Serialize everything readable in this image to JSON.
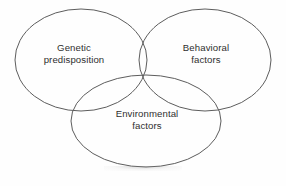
{
  "diagram": {
    "type": "venn-three-circle",
    "title": "",
    "background_color": "#fefefe",
    "outline_color": "#5d5d5d",
    "text_color": "#2f2f2f",
    "sets": [
      {
        "id": "genetic",
        "label_lines": [
          "Genetic",
          "predisposition"
        ],
        "line1": "Genetic",
        "line2": "predisposition",
        "position": "upper-left"
      },
      {
        "id": "behavioral",
        "label_lines": [
          "Behavioral",
          "factors"
        ],
        "line1": "Behavioral",
        "line2": "factors",
        "position": "upper-right"
      },
      {
        "id": "environmental",
        "label_lines": [
          "Environmental",
          "factors"
        ],
        "line1": "Environmental",
        "line2": "factors",
        "position": "bottom-center"
      }
    ],
    "geometry": {
      "genetic": {
        "cx": 81,
        "cy": 60,
        "rx": 66,
        "ry": 51
      },
      "behavioral": {
        "cx": 205,
        "cy": 60,
        "rx": 66,
        "ry": 51
      },
      "environmental": {
        "cx": 146,
        "cy": 121,
        "rx": 75,
        "ry": 46
      }
    }
  }
}
